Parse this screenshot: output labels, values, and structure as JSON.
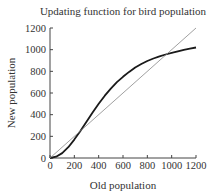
{
  "chart_data": {
    "type": "line",
    "title": "Updating function for bird population",
    "xlabel": "Old population",
    "ylabel": "New population",
    "xlim": [
      0,
      1200
    ],
    "ylim": [
      0,
      1200
    ],
    "xticks": [
      0,
      200,
      400,
      600,
      800,
      1000,
      1200
    ],
    "yticks": [
      0,
      200,
      400,
      600,
      800,
      1000,
      1200
    ],
    "grid": false,
    "legend": null,
    "series": [
      {
        "name": "Updating function",
        "style": "thick dark curve",
        "x": [
          0,
          50,
          100,
          150,
          200,
          250,
          300,
          350,
          400,
          450,
          500,
          550,
          600,
          650,
          700,
          750,
          800,
          850,
          900,
          950,
          1000,
          1050,
          1100,
          1150,
          1200
        ],
        "y": [
          0,
          12,
          45,
          100,
          170,
          250,
          335,
          420,
          500,
          575,
          640,
          700,
          750,
          795,
          835,
          868,
          895,
          918,
          938,
          955,
          970,
          985,
          998,
          1010,
          1020
        ]
      },
      {
        "name": "Diagonal (new = old)",
        "style": "thin gray line",
        "x": [
          0,
          1200
        ],
        "y": [
          0,
          1200
        ]
      }
    ]
  }
}
